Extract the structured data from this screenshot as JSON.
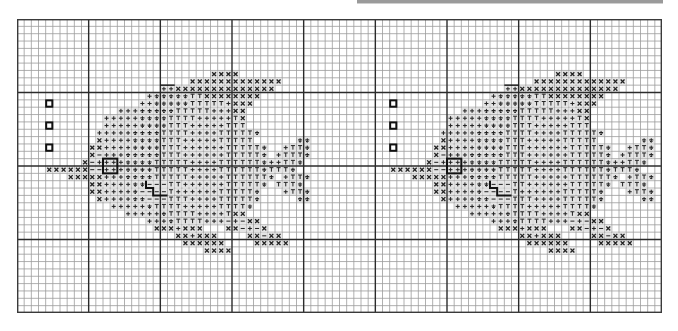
{
  "page": {
    "kind": "cross-stitch pattern chart",
    "top_bar_color": "#9a9a9a"
  },
  "grid": {
    "cols": 90,
    "rows": 40,
    "major_every": 10,
    "minor_color": "#9c9c9c",
    "major_color": "#2b2b2b",
    "border_color": "#3a3a3a"
  },
  "symbols": {
    "x": {
      "name": "cross-symbol",
      "glyph": "×"
    },
    "+": {
      "name": "plus-symbol",
      "glyph": "+"
    },
    "d": {
      "name": "anchor-down-symbol",
      "glyph": "⏚"
    },
    "T": {
      "name": "tee-symbol",
      "glyph": "T"
    },
    "-": {
      "name": "dash-symbol",
      "glyph": "−"
    }
  },
  "motifs": [
    {
      "name": "motif-left",
      "col_offset": 0
    },
    {
      "name": "motif-right",
      "col_offset": 48
    }
  ],
  "pattern_rows": [
    {
      "r": 7,
      "cells": [
        [
          27,
          30,
          "x"
        ]
      ]
    },
    {
      "r": 8,
      "cells": [
        [
          24,
          36,
          "x"
        ]
      ]
    },
    {
      "r": 9,
      "cells": [
        [
          20,
          21,
          "+"
        ],
        [
          22,
          35,
          "x"
        ]
      ]
    },
    {
      "r": 10,
      "cells": [
        [
          18,
          18,
          "+"
        ],
        [
          19,
          23,
          "d"
        ],
        [
          24,
          25,
          "T"
        ],
        [
          26,
          33,
          "x"
        ]
      ]
    },
    {
      "r": 11,
      "cells": [
        [
          17,
          18,
          "+"
        ],
        [
          19,
          23,
          "d"
        ],
        [
          24,
          28,
          "T"
        ],
        [
          29,
          29,
          "+"
        ],
        [
          30,
          32,
          "x"
        ]
      ]
    },
    {
      "r": 12,
      "cells": [
        [
          14,
          16,
          "+"
        ],
        [
          17,
          21,
          "d"
        ],
        [
          22,
          26,
          "T"
        ],
        [
          27,
          29,
          "+"
        ],
        [
          30,
          31,
          "x"
        ]
      ]
    },
    {
      "r": 13,
      "cells": [
        [
          12,
          16,
          "+"
        ],
        [
          17,
          20,
          "d"
        ],
        [
          21,
          24,
          "T"
        ],
        [
          25,
          29,
          "+"
        ],
        [
          30,
          30,
          "T"
        ],
        [
          31,
          31,
          "x"
        ]
      ]
    },
    {
      "r": 14,
      "cells": [
        [
          12,
          16,
          "+"
        ],
        [
          17,
          20,
          "d"
        ],
        [
          21,
          23,
          "T"
        ],
        [
          24,
          28,
          "+"
        ],
        [
          29,
          31,
          "T"
        ]
      ]
    },
    {
      "r": 15,
      "cells": [
        [
          11,
          15,
          "+"
        ],
        [
          16,
          19,
          "d"
        ],
        [
          20,
          23,
          "T"
        ],
        [
          24,
          27,
          "+"
        ],
        [
          28,
          32,
          "T"
        ],
        [
          33,
          33,
          "d"
        ]
      ]
    },
    {
      "r": 16,
      "cells": [
        [
          11,
          11,
          "x"
        ],
        [
          12,
          15,
          "+"
        ],
        [
          16,
          19,
          "d"
        ],
        [
          20,
          22,
          "T"
        ],
        [
          23,
          27,
          "+"
        ],
        [
          28,
          32,
          "T"
        ],
        [
          39,
          40,
          "d"
        ]
      ]
    },
    {
      "r": 17,
      "cells": [
        [
          10,
          11,
          "x"
        ],
        [
          12,
          15,
          "+"
        ],
        [
          16,
          19,
          "d"
        ],
        [
          20,
          22,
          "T"
        ],
        [
          23,
          28,
          "+"
        ],
        [
          29,
          33,
          "T"
        ],
        [
          34,
          34,
          "d"
        ],
        [
          37,
          37,
          "+"
        ],
        [
          38,
          39,
          "T"
        ],
        [
          40,
          40,
          "d"
        ]
      ]
    },
    {
      "r": 18,
      "cells": [
        [
          10,
          10,
          "x"
        ],
        [
          11,
          11,
          "-"
        ],
        [
          12,
          14,
          "+"
        ],
        [
          15,
          19,
          "d"
        ],
        [
          20,
          22,
          "T"
        ],
        [
          23,
          28,
          "+"
        ],
        [
          29,
          33,
          "T"
        ],
        [
          34,
          34,
          "d"
        ],
        [
          36,
          36,
          "+"
        ],
        [
          37,
          39,
          "T"
        ],
        [
          40,
          40,
          "d"
        ]
      ]
    },
    {
      "r": 19,
      "cells": [
        [
          9,
          9,
          "x"
        ],
        [
          10,
          10,
          "-"
        ],
        [
          11,
          14,
          "+"
        ],
        [
          15,
          18,
          "d"
        ],
        [
          19,
          23,
          "T"
        ],
        [
          24,
          27,
          "+"
        ],
        [
          28,
          33,
          "T"
        ],
        [
          34,
          34,
          "d"
        ],
        [
          35,
          36,
          "+"
        ],
        [
          37,
          38,
          "T"
        ],
        [
          39,
          39,
          "d"
        ]
      ]
    },
    {
      "r": 20,
      "cells": [
        [
          4,
          9,
          "x"
        ],
        [
          10,
          11,
          "-"
        ],
        [
          12,
          14,
          "+"
        ],
        [
          15,
          18,
          "d"
        ],
        [
          19,
          23,
          "T"
        ],
        [
          24,
          27,
          "+"
        ],
        [
          28,
          33,
          "T"
        ],
        [
          34,
          34,
          "d"
        ],
        [
          35,
          37,
          "T"
        ],
        [
          38,
          38,
          "d"
        ]
      ]
    },
    {
      "r": 21,
      "cells": [
        [
          7,
          11,
          "x"
        ],
        [
          12,
          14,
          "+"
        ],
        [
          15,
          18,
          "d"
        ],
        [
          19,
          23,
          "T"
        ],
        [
          24,
          28,
          "+"
        ],
        [
          29,
          34,
          "T"
        ],
        [
          35,
          35,
          "d"
        ],
        [
          37,
          37,
          "+"
        ],
        [
          38,
          39,
          "T"
        ],
        [
          40,
          40,
          "d"
        ]
      ]
    },
    {
      "r": 22,
      "cells": [
        [
          10,
          11,
          "x"
        ],
        [
          12,
          15,
          "+"
        ],
        [
          16,
          17,
          "d"
        ],
        [
          18,
          20,
          "-"
        ],
        [
          21,
          22,
          "T"
        ],
        [
          23,
          28,
          "+"
        ],
        [
          29,
          33,
          "T"
        ],
        [
          34,
          34,
          "d"
        ],
        [
          36,
          38,
          "T"
        ],
        [
          39,
          39,
          "d"
        ]
      ]
    },
    {
      "r": 23,
      "cells": [
        [
          10,
          11,
          "x"
        ],
        [
          12,
          15,
          "+"
        ],
        [
          16,
          16,
          "d"
        ],
        [
          17,
          20,
          "-"
        ],
        [
          21,
          21,
          "T"
        ],
        [
          22,
          27,
          "+"
        ],
        [
          28,
          32,
          "T"
        ],
        [
          33,
          33,
          "d"
        ],
        [
          37,
          37,
          "+"
        ],
        [
          38,
          39,
          "T"
        ],
        [
          40,
          40,
          "d"
        ]
      ]
    },
    {
      "r": 24,
      "cells": [
        [
          11,
          11,
          "x"
        ],
        [
          12,
          15,
          "+"
        ],
        [
          16,
          17,
          "d"
        ],
        [
          18,
          20,
          "-"
        ],
        [
          21,
          23,
          "T"
        ],
        [
          24,
          27,
          "+"
        ],
        [
          28,
          32,
          "T"
        ],
        [
          33,
          33,
          "d"
        ],
        [
          39,
          40,
          "d"
        ]
      ]
    },
    {
      "r": 25,
      "cells": [
        [
          13,
          17,
          "+"
        ],
        [
          18,
          18,
          "d"
        ],
        [
          19,
          22,
          "T"
        ],
        [
          23,
          27,
          "+"
        ],
        [
          28,
          31,
          "T"
        ],
        [
          32,
          32,
          "d"
        ]
      ]
    },
    {
      "r": 26,
      "cells": [
        [
          15,
          19,
          "+"
        ],
        [
          20,
          20,
          "d"
        ],
        [
          21,
          24,
          "T"
        ],
        [
          25,
          28,
          "+"
        ],
        [
          29,
          29,
          "T"
        ],
        [
          30,
          31,
          "x"
        ]
      ]
    },
    {
      "r": 27,
      "cells": [
        [
          18,
          20,
          "+"
        ],
        [
          21,
          21,
          "d"
        ],
        [
          22,
          25,
          "T"
        ],
        [
          26,
          28,
          "+"
        ],
        [
          29,
          29,
          "-"
        ],
        [
          30,
          30,
          "+"
        ],
        [
          31,
          31,
          "-"
        ],
        [
          32,
          33,
          "x"
        ]
      ]
    },
    {
      "r": 28,
      "cells": [
        [
          19,
          21,
          "x"
        ],
        [
          22,
          22,
          "+"
        ],
        [
          23,
          25,
          "x"
        ],
        [
          29,
          30,
          "x"
        ],
        [
          31,
          31,
          "-"
        ],
        [
          32,
          32,
          "+"
        ],
        [
          33,
          33,
          "-"
        ],
        [
          34,
          34,
          "x"
        ]
      ]
    },
    {
      "r": 29,
      "cells": [
        [
          22,
          23,
          "x"
        ],
        [
          24,
          24,
          "+"
        ],
        [
          25,
          27,
          "x"
        ],
        [
          32,
          33,
          "x"
        ],
        [
          34,
          34,
          "-"
        ],
        [
          35,
          36,
          "x"
        ]
      ]
    },
    {
      "r": 30,
      "cells": [
        [
          23,
          28,
          "x"
        ],
        [
          33,
          37,
          "x"
        ]
      ]
    },
    {
      "r": 31,
      "cells": [
        [
          26,
          29,
          "x"
        ]
      ]
    }
  ],
  "markers": {
    "small_squares": [
      {
        "c": 4,
        "r": 11
      },
      {
        "c": 4,
        "r": 14
      },
      {
        "c": 4,
        "r": 17
      }
    ],
    "bold_box": {
      "c": 12,
      "r": 19,
      "w": 2,
      "h": 2
    },
    "stair_path": [
      [
        18,
        22
      ],
      [
        18,
        23
      ],
      [
        19,
        23
      ],
      [
        19,
        24
      ],
      [
        21,
        24
      ]
    ],
    "top_notch": [
      [
        20,
        9
      ],
      [
        22,
        9
      ]
    ]
  }
}
